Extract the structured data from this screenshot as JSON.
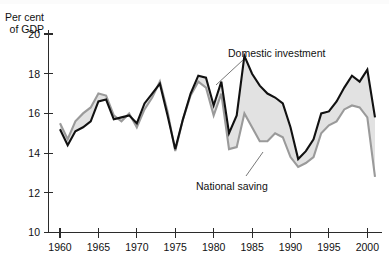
{
  "chart_data": {
    "type": "area",
    "title": "",
    "subtitle": "",
    "xlabel": "",
    "ylabel": "Per cent of GDP",
    "ylabel_line1": "Per cent",
    "ylabel_line2": "of GDP",
    "xlim": [
      1960,
      2001
    ],
    "ylim": [
      10,
      20
    ],
    "yticks": [
      10,
      12,
      14,
      16,
      18,
      20
    ],
    "ytick_labels": [
      "10",
      "12",
      "14",
      "16",
      "18",
      "20"
    ],
    "xticks": [
      1960,
      1965,
      1970,
      1975,
      1980,
      1985,
      1990,
      1995,
      2000
    ],
    "xtick_labels": [
      "1960",
      "1965",
      "1970",
      "1975",
      "1980",
      "1985",
      "1990",
      "1995",
      "2000"
    ],
    "grid": false,
    "legend_position": "inline-annotation",
    "x": [
      1960,
      1961,
      1962,
      1963,
      1964,
      1965,
      1966,
      1967,
      1968,
      1969,
      1970,
      1971,
      1972,
      1973,
      1974,
      1975,
      1976,
      1977,
      1978,
      1979,
      1980,
      1981,
      1982,
      1983,
      1984,
      1985,
      1986,
      1987,
      1988,
      1989,
      1990,
      1991,
      1992,
      1993,
      1994,
      1995,
      1996,
      1997,
      1998,
      1999,
      2000,
      2001
    ],
    "series": [
      {
        "name": "Domestic investment",
        "color": "#111111",
        "values": [
          15.2,
          14.4,
          15.1,
          15.3,
          15.6,
          16.6,
          16.7,
          15.7,
          15.8,
          15.9,
          15.5,
          16.5,
          17.0,
          17.5,
          15.9,
          14.2,
          15.7,
          17.0,
          17.9,
          17.8,
          16.4,
          17.6,
          15.0,
          15.9,
          18.9,
          18.0,
          17.4,
          17.0,
          16.8,
          16.5,
          15.3,
          13.7,
          14.1,
          14.7,
          16.0,
          16.1,
          16.6,
          17.3,
          17.9,
          17.6,
          18.2,
          15.8
        ]
      },
      {
        "name": "National saving",
        "color": "#9a9a9a",
        "values": [
          15.5,
          14.7,
          15.6,
          16.0,
          16.3,
          17.0,
          16.9,
          15.9,
          15.6,
          16.0,
          15.3,
          16.2,
          16.8,
          17.6,
          16.1,
          14.1,
          15.7,
          16.9,
          17.6,
          17.3,
          15.9,
          17.0,
          14.2,
          14.3,
          16.0,
          15.3,
          14.6,
          14.6,
          15.0,
          14.8,
          13.8,
          13.3,
          13.5,
          13.8,
          15.0,
          15.4,
          15.6,
          16.2,
          16.4,
          16.3,
          15.8,
          12.8
        ]
      }
    ],
    "annotations": [
      {
        "name": "domestic-investment-label",
        "text": "Domestic investment",
        "x": 1984,
        "y": 19.6
      },
      {
        "name": "national-saving-label",
        "text": "National saving",
        "x": 1984,
        "y": 11.6
      }
    ]
  },
  "axis": {
    "y_title_line1": "Per cent",
    "y_title_line2": "of GDP"
  }
}
